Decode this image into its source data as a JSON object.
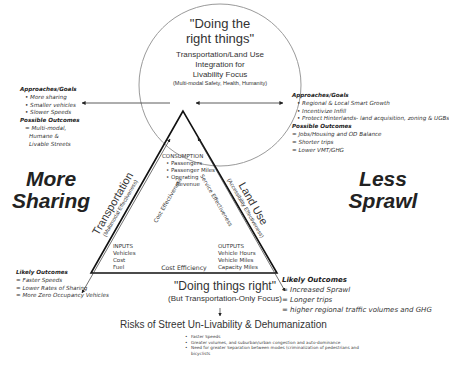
{
  "circle": {
    "title_line1": "\"Doing the",
    "title_line2": "right things\"",
    "subtitle_line1": "Transportation/Land Use",
    "subtitle_line2": "Integration for",
    "subtitle_line3": "Livability Focus",
    "note": "(Multi-modal Safety, Health, Humanity)"
  },
  "left_panel": {
    "approaches_heading": "Approaches/Goals",
    "approaches": [
      "More sharing",
      "Smaller vehicles",
      "Slower Speeds"
    ],
    "outcomes_heading": "Possible Outcomes",
    "outcomes": [
      "= Multi-modal,",
      "Humane &",
      "Livable Streets"
    ]
  },
  "right_panel": {
    "approaches_heading": "Approaches/Goals",
    "approaches": [
      "Regional & Local Smart Growth",
      "Incentivize Infill",
      "Protect Hinterlands- land acquisition, zoning & UGBs"
    ],
    "outcomes_heading": "Possible Outcomes",
    "outcomes": [
      "= Jobs/Housing and OD Balance",
      "= Shorter trips",
      "= Lower VMT/GHG"
    ]
  },
  "big_labels": {
    "left_line1": "More",
    "left_line2": "Sharing",
    "right_line1": "Less",
    "right_line2": "Sprawl"
  },
  "triangle": {
    "consumption_heading": "CONSUMPTION",
    "consumption_items": [
      "Passengers",
      "Passenger Miles",
      "Operating",
      "Revenue"
    ],
    "inputs_heading": "INPUTS",
    "inputs_items": [
      "Vehicles",
      "Cost",
      "Fuel"
    ],
    "outputs_heading": "OUTPUTS",
    "outputs_items": [
      "Vehicle Hours",
      "Vehicle Miles",
      "Capacity Miles"
    ],
    "left_edge_label": "Cost Effectiveness",
    "right_edge_label": "Service Effectiveness",
    "bottom_edge_label": "Cost Efficiency",
    "left_axis_label": "Transportation",
    "left_axis_sub": "(Multimodal Effectiveness)",
    "right_axis_label": "Land Use",
    "right_axis_sub": "(Accessibility Effectiveness)"
  },
  "bottom": {
    "title": "\"Doing things right\"",
    "subtitle": "(But Transportation-Only Focus)"
  },
  "left_outcomes": {
    "heading": "Likely Outcomes",
    "items": [
      "= Faster Speeds",
      "= Lower Rates of Sharing",
      "= More Zero Occupancy Vehicles"
    ]
  },
  "right_outcomes": {
    "heading": "Likely Outcomes",
    "items": [
      "= Increased Sprawl",
      "= Longer trips",
      "=  higher regional traffic volumes and GHG"
    ]
  },
  "risks": {
    "title": "Risks of Street Un-Livability & Dehumanization",
    "items": [
      "Faster Speeds",
      "Greater volumes, and suburban/urban congestion and auto-dominance",
      "Need for greater Separation between modes (criminalization of pedestrians and bicyclists"
    ]
  },
  "colors": {
    "triangle_stroke": "#111111",
    "circle_stroke": "#9a9a9a",
    "arrow_stroke": "#333333",
    "text": "#222222"
  }
}
